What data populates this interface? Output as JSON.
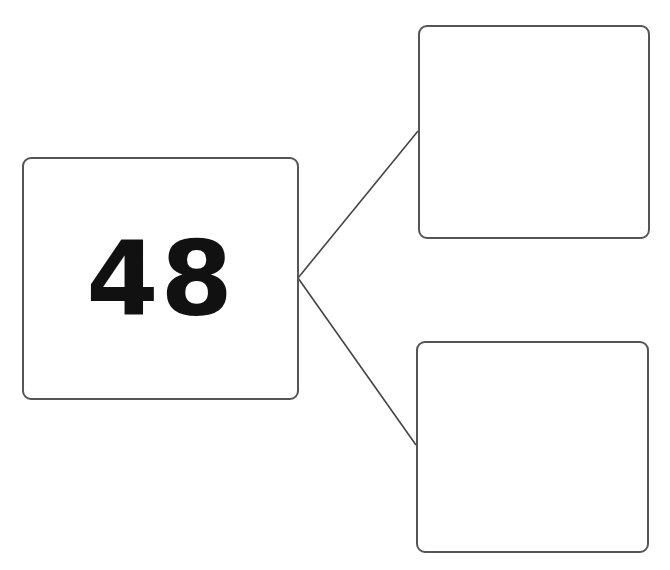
{
  "diagram": {
    "type": "number-bond",
    "whole": {
      "value": "48"
    },
    "parts": [
      {
        "position": "top",
        "value": ""
      },
      {
        "position": "bottom",
        "value": ""
      }
    ],
    "colors": {
      "stroke": "#555555",
      "text": "#111111",
      "background": "#ffffff"
    }
  }
}
